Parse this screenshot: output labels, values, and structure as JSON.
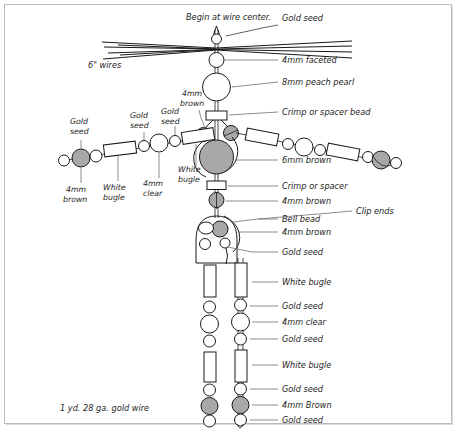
{
  "diagram": {
    "title_note": "Begin at wire center.",
    "wire_note": "6\" wires",
    "materials_note": "1 yd. 28 ga. gold wire"
  },
  "labels": {
    "begin_at_wire_center": "Begin at wire center.",
    "gold_seed": "Gold seed",
    "four_mm_faceted": "4mm faceted",
    "eight_mm_peach_pearl": "8mm peach pearl",
    "crimp_or_spacer_bead": "Crimp or spacer bead",
    "crimp_or_spacer": "Crimp or spacer",
    "six_mm_brown": "6mm brown",
    "four_mm_brown": "4mm brown",
    "four_mm_brown_cap": "4mm Brown",
    "four_mm_clear": "4mm clear",
    "white_bugle": "White bugle",
    "bell_bead": "Bell bead",
    "clip_ends": "Clip ends",
    "six_inch_wires": "6\" wires",
    "gold_wire_note": "1 yd. 28 ga. gold wire"
  },
  "left_arm_labels": {
    "gold_seed_1": "Gold",
    "gold_seed_1b": "seed",
    "gold_seed_2": "Gold",
    "gold_seed_2b": "seed",
    "gold_seed_3": "Gold",
    "gold_seed_3b": "seed",
    "four_mm_brown_a": "4mm",
    "four_mm_brown_b": "brown",
    "white_bugle_a": "White",
    "white_bugle_b": "bugle",
    "four_mm_clear_a": "4mm",
    "four_mm_clear_b": "clear",
    "white_bugle2_a": "White",
    "white_bugle2_b": "bugle",
    "shoulder_a": "4mm",
    "shoulder_b": "brown"
  },
  "colors": {
    "bead_gray": "#a8a8a8",
    "outline": "#1a1a1a",
    "leader": "#6d7074",
    "frame_border": "#b9bcc0",
    "background": "#ffffff"
  },
  "bead_counts": {
    "total_gold_seed_labels": 11,
    "total_white_bugle_labels": 5,
    "total_four_mm_brown_labels": 5
  }
}
